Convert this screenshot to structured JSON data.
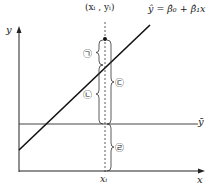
{
  "diagram": {
    "point_label": "(xᵢ , yᵢ)",
    "regression_label": "ŷ = β̂₀ + β̂₁x",
    "axis_x_label": "x",
    "axis_y_label": "y",
    "mean_label": "ȳ",
    "xi_label": "xᵢ",
    "braces": [
      {
        "id": "giyeok",
        "label": "㉠",
        "side": "left",
        "meaning": "yᵢ − ŷᵢ"
      },
      {
        "id": "nieun",
        "label": "㉡",
        "side": "left",
        "meaning": "ŷᵢ − ȳ"
      },
      {
        "id": "digeut",
        "label": "㉢",
        "side": "right",
        "meaning": "yᵢ − ȳ"
      },
      {
        "id": "rieul",
        "label": "㉣",
        "side": "right",
        "meaning": "ȳ"
      }
    ],
    "colors": {
      "line": "#222222",
      "background": "#ffffff"
    }
  }
}
